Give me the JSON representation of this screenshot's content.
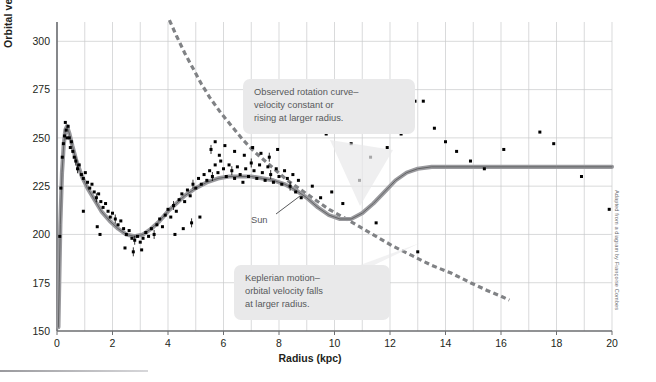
{
  "figure": {
    "credit": "Adapted from a diagram by Françoise Combes"
  },
  "chart_data": {
    "type": "scatter",
    "title": "",
    "xlabel": "Radius (kpc)",
    "ylabel": "Orbital velocity (km/s)",
    "xlim": [
      0,
      20
    ],
    "ylim": [
      150,
      310
    ],
    "xticks": [
      0,
      2,
      4,
      6,
      8,
      10,
      12,
      14,
      16,
      18,
      20
    ],
    "xtick_labels": [
      "0",
      "2",
      "4",
      "6",
      "8",
      "10",
      "12",
      "14",
      "16",
      "18",
      "20"
    ],
    "yticks": [
      150,
      175,
      200,
      225,
      250,
      275,
      300
    ],
    "ytick_labels": [
      "150",
      "175",
      "200",
      "225",
      "250",
      "275",
      "300"
    ],
    "grid": true,
    "grid_minor_x_step": 1,
    "legend": "none",
    "annotations": [
      {
        "name": "observed-rotation-curve",
        "text": "Observed rotation curve–\nvelocity constant or\nrising at larger radius.",
        "points_to": [
          12.0,
          231
        ]
      },
      {
        "name": "keplerian-motion",
        "text": "Keplerian motion–\norbital velocity falls\nat larger radius.",
        "points_to": [
          11.6,
          197
        ]
      },
      {
        "name": "sun-marker",
        "text": "Sun",
        "points_to": [
          8.4,
          228
        ]
      }
    ],
    "series": [
      {
        "name": "Observed rotation curve (model)",
        "type": "line",
        "style": "solid",
        "color": "#9a9a9e",
        "core_color": "#58595b",
        "points": [
          [
            0.05,
            152
          ],
          [
            0.08,
            175
          ],
          [
            0.12,
            205
          ],
          [
            0.18,
            232
          ],
          [
            0.24,
            246
          ],
          [
            0.3,
            254
          ],
          [
            0.36,
            256
          ],
          [
            0.45,
            252
          ],
          [
            0.55,
            246
          ],
          [
            0.7,
            238
          ],
          [
            0.9,
            230
          ],
          [
            1.1,
            224
          ],
          [
            1.35,
            218
          ],
          [
            1.6,
            212
          ],
          [
            1.9,
            207
          ],
          [
            2.2,
            203
          ],
          [
            2.5,
            200
          ],
          [
            2.8,
            199
          ],
          [
            3.1,
            200
          ],
          [
            3.4,
            203
          ],
          [
            3.7,
            207
          ],
          [
            4.0,
            212
          ],
          [
            4.3,
            216
          ],
          [
            4.6,
            220
          ],
          [
            5.0,
            224
          ],
          [
            5.4,
            227
          ],
          [
            5.8,
            229
          ],
          [
            6.2,
            230
          ],
          [
            6.6,
            230
          ],
          [
            7.0,
            230
          ],
          [
            7.4,
            229
          ],
          [
            7.8,
            228
          ],
          [
            8.2,
            226
          ],
          [
            8.6,
            223
          ],
          [
            9.0,
            219
          ],
          [
            9.4,
            214
          ],
          [
            9.8,
            210
          ],
          [
            10.2,
            208
          ],
          [
            10.6,
            208
          ],
          [
            11.0,
            211
          ],
          [
            11.4,
            216
          ],
          [
            11.8,
            222
          ],
          [
            12.2,
            228
          ],
          [
            12.6,
            232
          ],
          [
            13.0,
            234
          ],
          [
            13.5,
            235
          ],
          [
            14.0,
            235
          ],
          [
            15.0,
            235
          ],
          [
            16.0,
            235
          ],
          [
            17.0,
            235
          ],
          [
            18.0,
            235
          ],
          [
            19.0,
            235
          ],
          [
            20.0,
            235
          ]
        ]
      },
      {
        "name": "Keplerian prediction",
        "type": "line",
        "style": "dashed",
        "color": "#808285",
        "points": [
          [
            4.05,
            311
          ],
          [
            4.3,
            303
          ],
          [
            4.6,
            294
          ],
          [
            4.9,
            286
          ],
          [
            5.2,
            278
          ],
          [
            5.5,
            271
          ],
          [
            5.9,
            263
          ],
          [
            6.3,
            256
          ],
          [
            6.7,
            249
          ],
          [
            7.1,
            243
          ],
          [
            7.5,
            238
          ],
          [
            7.9,
            233
          ],
          [
            8.3,
            228
          ],
          [
            8.8,
            223
          ],
          [
            9.3,
            218
          ],
          [
            9.8,
            213
          ],
          [
            10.3,
            209
          ],
          [
            10.9,
            204
          ],
          [
            11.5,
            199
          ],
          [
            12.1,
            194
          ],
          [
            12.8,
            189
          ],
          [
            13.5,
            184
          ],
          [
            14.2,
            180
          ],
          [
            14.9,
            175
          ],
          [
            15.5,
            171
          ],
          [
            16.0,
            168
          ],
          [
            16.3,
            166
          ]
        ]
      }
    ],
    "scatter": {
      "name": "Measured orbital velocities",
      "marker": "square",
      "color": "#000000",
      "points": [
        [
          0.1,
          199
        ],
        [
          0.14,
          224
        ],
        [
          0.19,
          240
        ],
        [
          0.23,
          247
        ],
        [
          0.27,
          251
        ],
        [
          0.3,
          258
        ],
        [
          0.33,
          254
        ],
        [
          0.36,
          250
        ],
        [
          0.4,
          256
        ],
        [
          0.44,
          250
        ],
        [
          0.48,
          245
        ],
        [
          0.52,
          248
        ],
        [
          0.57,
          243
        ],
        [
          0.62,
          240
        ],
        [
          0.68,
          238
        ],
        [
          0.74,
          234
        ],
        [
          0.8,
          236
        ],
        [
          0.88,
          231
        ],
        [
          0.95,
          229
        ],
        [
          1.02,
          232
        ],
        [
          1.1,
          227
        ],
        [
          1.18,
          224
        ],
        [
          1.26,
          226
        ],
        [
          1.34,
          222
        ],
        [
          1.42,
          219
        ],
        [
          1.5,
          221
        ],
        [
          1.58,
          217
        ],
        [
          1.66,
          214
        ],
        [
          1.75,
          216
        ],
        [
          1.84,
          212
        ],
        [
          1.92,
          209
        ],
        [
          2.0,
          211
        ],
        [
          2.1,
          208
        ],
        [
          2.2,
          205
        ],
        [
          2.3,
          207
        ],
        [
          2.4,
          203
        ],
        [
          2.5,
          200
        ],
        [
          2.6,
          202
        ],
        [
          2.7,
          198
        ],
        [
          2.8,
          197
        ],
        [
          2.9,
          199
        ],
        [
          3.0,
          196
        ],
        [
          3.1,
          198
        ],
        [
          3.2,
          201
        ],
        [
          3.3,
          199
        ],
        [
          3.4,
          203
        ],
        [
          3.5,
          200
        ],
        [
          3.6,
          205
        ],
        [
          3.7,
          208
        ],
        [
          3.8,
          204
        ],
        [
          3.9,
          210
        ],
        [
          4.0,
          213
        ],
        [
          4.1,
          209
        ],
        [
          4.2,
          215
        ],
        [
          4.3,
          212
        ],
        [
          4.4,
          218
        ],
        [
          4.5,
          221
        ],
        [
          4.6,
          217
        ],
        [
          4.7,
          223
        ],
        [
          4.8,
          220
        ],
        [
          4.9,
          226
        ],
        [
          5.0,
          224
        ],
        [
          5.1,
          229
        ],
        [
          5.2,
          226
        ],
        [
          5.3,
          231
        ],
        [
          5.4,
          228
        ],
        [
          5.5,
          233
        ],
        [
          5.6,
          230
        ],
        [
          5.7,
          236
        ],
        [
          5.8,
          232
        ],
        [
          5.9,
          238
        ],
        [
          6.0,
          234
        ],
        [
          6.1,
          230
        ],
        [
          6.2,
          236
        ],
        [
          6.3,
          233
        ],
        [
          6.4,
          229
        ],
        [
          6.5,
          235
        ],
        [
          6.6,
          231
        ],
        [
          6.7,
          227
        ],
        [
          6.8,
          234
        ],
        [
          6.9,
          230
        ],
        [
          7.0,
          237
        ],
        [
          7.1,
          233
        ],
        [
          7.2,
          229
        ],
        [
          7.3,
          236
        ],
        [
          7.4,
          232
        ],
        [
          7.5,
          228
        ],
        [
          7.6,
          235
        ],
        [
          7.7,
          231
        ],
        [
          7.8,
          227
        ],
        [
          7.9,
          234
        ],
        [
          8.0,
          230
        ],
        [
          8.1,
          226
        ],
        [
          8.2,
          233
        ],
        [
          8.3,
          229
        ],
        [
          8.4,
          225
        ],
        [
          8.5,
          231
        ],
        [
          8.6,
          222
        ],
        [
          8.7,
          228
        ],
        [
          8.8,
          219
        ],
        [
          5.55,
          244
        ],
        [
          5.7,
          248
        ],
        [
          5.85,
          241
        ],
        [
          6.05,
          246
        ],
        [
          6.4,
          243
        ],
        [
          6.75,
          241
        ],
        [
          7.05,
          245
        ],
        [
          7.35,
          242
        ],
        [
          7.65,
          240
        ],
        [
          7.95,
          244
        ],
        [
          4.25,
          200
        ],
        [
          4.55,
          203
        ],
        [
          4.85,
          206
        ],
        [
          5.15,
          209
        ],
        [
          2.45,
          193
        ],
        [
          2.75,
          191
        ],
        [
          3.05,
          192
        ],
        [
          1.45,
          204
        ],
        [
          1.55,
          200
        ],
        [
          0.95,
          212
        ],
        [
          9.2,
          225
        ],
        [
          9.5,
          219
        ],
        [
          9.9,
          222
        ],
        [
          10.3,
          216
        ],
        [
          10.9,
          228
        ],
        [
          11.3,
          240
        ],
        [
          11.9,
          245
        ],
        [
          12.4,
          252
        ],
        [
          12.9,
          269
        ],
        [
          13.2,
          269
        ],
        [
          13.6,
          255
        ],
        [
          14.0,
          248
        ],
        [
          14.4,
          243
        ],
        [
          14.9,
          238
        ],
        [
          15.4,
          234
        ],
        [
          13.0,
          191
        ],
        [
          16.1,
          244
        ],
        [
          17.4,
          253
        ],
        [
          17.9,
          247
        ],
        [
          18.9,
          230
        ],
        [
          19.9,
          213
        ],
        [
          11.5,
          206
        ],
        [
          10.6,
          247
        ],
        [
          9.7,
          252
        ]
      ],
      "errorbars": true
    }
  }
}
